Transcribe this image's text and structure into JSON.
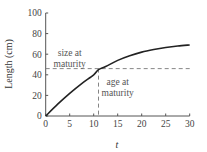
{
  "chart_data": {
    "type": "line",
    "title": "",
    "xlabel": "t",
    "ylabel": "Length (cm)",
    "xlim": [
      0,
      30
    ],
    "ylim": [
      0,
      100
    ],
    "xticks": [
      0,
      5,
      10,
      15,
      20,
      25,
      30
    ],
    "yticks": [
      0,
      20,
      40,
      60,
      80,
      100
    ],
    "grid": false,
    "legend": null,
    "series": [
      {
        "name": "growth curve",
        "x": [
          0,
          2.5,
          5,
          7.5,
          10,
          11,
          12.5,
          15,
          17.5,
          20,
          22.5,
          25,
          27.5,
          30
        ],
        "y": [
          0,
          11.5,
          22,
          31.5,
          40,
          45,
          48,
          54,
          58.5,
          62,
          64.5,
          66.5,
          68,
          69
        ]
      }
    ],
    "reference_lines": [
      {
        "orientation": "horizontal",
        "value": 46,
        "style": "dashed",
        "label": "size at maturity",
        "x_range": [
          0,
          30
        ]
      },
      {
        "orientation": "vertical",
        "value": 11,
        "style": "dashed",
        "label": "age at maturity",
        "y_range": [
          0,
          46
        ]
      }
    ],
    "annotations": [
      {
        "text_lines": [
          "size at",
          "maturity"
        ],
        "x": 5,
        "y": 58
      },
      {
        "text_lines": [
          "age at",
          "maturity"
        ],
        "x": 15,
        "y": 30
      }
    ]
  }
}
